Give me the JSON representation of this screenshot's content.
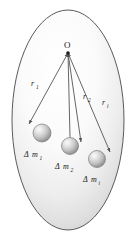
{
  "figure": {
    "type": "physics-diagram",
    "background_color": "#ffffff",
    "body_outline_color": "#4a4a4a",
    "body_fill_light": "#ffffff",
    "body_fill_shadow": "#c9c9c9",
    "vector_line_color": "#555555",
    "sphere_highlight_color": "#f2f2f2",
    "sphere_shadow_color": "#8a8a8a",
    "label_color": "#1a1a1a"
  },
  "origin": {
    "label": "O",
    "x": 68,
    "y": 52
  },
  "vectors": [
    {
      "id": "r1",
      "symbol": "r",
      "subscript": "1",
      "label_x": 33,
      "label_y": 85,
      "from": {
        "x": 68,
        "y": 53
      },
      "to": {
        "x": 28,
        "y": 124
      }
    },
    {
      "id": "r2",
      "symbol": "r",
      "subscript": "2",
      "label_x": 85,
      "label_y": 98,
      "from": {
        "x": 68,
        "y": 53
      },
      "to": {
        "x": 82,
        "y": 143
      }
    },
    {
      "id": "ri",
      "symbol": "r",
      "subscript": "i",
      "label_x": 104,
      "label_y": 104,
      "from": {
        "x": 68,
        "y": 53
      },
      "to": {
        "x": 111,
        "y": 153
      }
    }
  ],
  "mass_elements": [
    {
      "id": "dm1",
      "delta": "Δ",
      "symbol": "m",
      "subscript": "1",
      "cx": 42,
      "cy": 133,
      "r": 9,
      "label_x": 24,
      "label_y": 156
    },
    {
      "id": "dm2",
      "delta": "Δ",
      "symbol": "m",
      "subscript": "2",
      "cx": 70,
      "cy": 146,
      "r": 8.5,
      "label_x": 56,
      "label_y": 168
    },
    {
      "id": "dmi",
      "delta": "Δ",
      "symbol": "m",
      "subscript": "i",
      "cx": 97,
      "cy": 159,
      "r": 8.5,
      "label_x": 85,
      "label_y": 181
    }
  ],
  "body_shape": {
    "cx": 68,
    "cy": 120,
    "rx": 56,
    "ry": 110
  }
}
